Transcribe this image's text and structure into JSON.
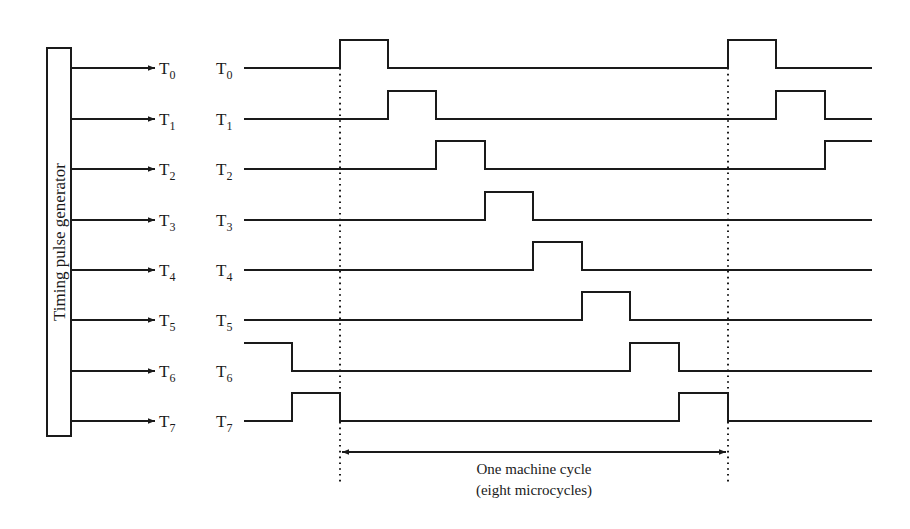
{
  "generator": {
    "label": "Timing pulse generator"
  },
  "outputs": [
    {
      "name": "T",
      "sub": "0",
      "y": 68
    },
    {
      "name": "T",
      "sub": "1",
      "y": 119
    },
    {
      "name": "T",
      "sub": "2",
      "y": 169
    },
    {
      "name": "T",
      "sub": "3",
      "y": 220
    },
    {
      "name": "T",
      "sub": "4",
      "y": 270
    },
    {
      "name": "T",
      "sub": "5",
      "y": 320
    },
    {
      "name": "T",
      "sub": "6",
      "y": 371
    },
    {
      "name": "T",
      "sub": "7",
      "y": 421
    }
  ],
  "timing": {
    "start_x": 244,
    "end_x": 872,
    "pulse_height": 28,
    "slot_edges_x": [
      340,
      388,
      436,
      485,
      533,
      582,
      630,
      679,
      728,
      776,
      825
    ],
    "signals": [
      {
        "label": "T0",
        "pulses": [
          [
            340,
            388
          ],
          [
            728,
            776
          ]
        ]
      },
      {
        "label": "T1",
        "pulses": [
          [
            388,
            436
          ],
          [
            776,
            825
          ]
        ]
      },
      {
        "label": "T2",
        "pulses": [
          [
            436,
            485
          ],
          [
            825,
            872
          ]
        ]
      },
      {
        "label": "T3",
        "pulses": [
          [
            485,
            533
          ]
        ]
      },
      {
        "label": "T4",
        "pulses": [
          [
            533,
            582
          ]
        ]
      },
      {
        "label": "T5",
        "pulses": [
          [
            582,
            630
          ]
        ]
      },
      {
        "label": "T6",
        "pulses": [
          [
            244,
            292
          ],
          [
            630,
            679
          ]
        ]
      },
      {
        "label": "T7",
        "pulses": [
          [
            292,
            340
          ],
          [
            679,
            728
          ]
        ]
      }
    ]
  },
  "cycle_markers": {
    "left_x": 340,
    "right_x": 728
  },
  "annotation": {
    "line1": "One machine cycle",
    "line2": "(eight microcycles)"
  }
}
